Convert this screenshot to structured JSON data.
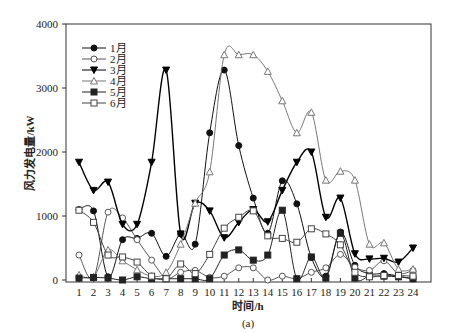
{
  "chart_data": {
    "type": "line",
    "title": "",
    "caption": "(a)",
    "xlabel": "时间/h",
    "ylabel": "风力发电量/kW",
    "x": [
      1,
      2,
      3,
      4,
      5,
      6,
      7,
      8,
      9,
      10,
      11,
      12,
      13,
      14,
      15,
      16,
      17,
      18,
      19,
      20,
      21,
      22,
      23,
      24
    ],
    "ylim": [
      0,
      4000
    ],
    "yticks": [
      0,
      1000,
      2000,
      3000,
      4000
    ],
    "grid": false,
    "legend_position": "upper-left",
    "series": [
      {
        "name": "1月",
        "marker": "filled-circle",
        "color": "#111111",
        "values": [
          1100,
          1080,
          50,
          630,
          650,
          730,
          370,
          720,
          560,
          2300,
          3280,
          2100,
          1280,
          730,
          1550,
          1190,
          350,
          60,
          750,
          230,
          100,
          100,
          60,
          20
        ]
      },
      {
        "name": "2月",
        "marker": "open-circle",
        "color": "#555555",
        "values": [
          390,
          30,
          1060,
          970,
          630,
          310,
          30,
          120,
          150,
          40,
          60,
          190,
          190,
          0,
          60,
          20,
          120,
          190,
          400,
          200,
          150,
          300,
          100,
          150
        ]
      },
      {
        "name": "3月",
        "marker": "filled-triangle-down",
        "color": "#000000",
        "values": [
          1840,
          1400,
          1530,
          870,
          870,
          1840,
          3280,
          720,
          1200,
          1080,
          660,
          900,
          1100,
          910,
          1400,
          1840,
          2000,
          980,
          1280,
          410,
          330,
          340,
          280,
          500
        ]
      },
      {
        "name": "4月",
        "marker": "open-triangle",
        "color": "#777777",
        "values": [
          80,
          50,
          470,
          300,
          160,
          60,
          120,
          560,
          1200,
          1690,
          3520,
          3520,
          3520,
          3260,
          2800,
          2300,
          2620,
          1560,
          1700,
          1560,
          560,
          580,
          170,
          170
        ]
      },
      {
        "name": "5月",
        "marker": "filled-square",
        "color": "#222222",
        "values": [
          30,
          40,
          30,
          0,
          50,
          20,
          20,
          20,
          20,
          20,
          390,
          470,
          310,
          390,
          1090,
          20,
          360,
          30,
          730,
          30,
          60,
          60,
          50,
          20
        ]
      },
      {
        "name": "6月",
        "marker": "open-square",
        "color": "#444444",
        "values": [
          1090,
          900,
          390,
          360,
          280,
          60,
          20,
          250,
          100,
          400,
          810,
          980,
          1080,
          690,
          650,
          590,
          800,
          720,
          550,
          120,
          50,
          70,
          70,
          60
        ]
      }
    ]
  }
}
